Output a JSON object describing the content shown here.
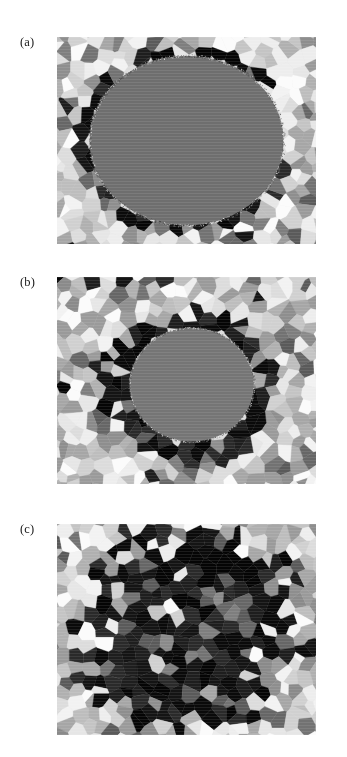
{
  "figure": {
    "background_color": "#ffffff",
    "width": 347,
    "height": 757,
    "panel_count": 3
  },
  "panels": [
    {
      "label": "(a)",
      "name": "panel-a",
      "description": "Large uniform grey elliptical particle surrounded by polycrystalline matrix with a thin ring of dark grains at the interface",
      "x": 57,
      "y": 37,
      "w": 259,
      "h": 207,
      "particle": {
        "present": true,
        "cx_pct": 50,
        "cy_pct": 50,
        "rx_pct": 37.5,
        "ry_pct": 41.0,
        "color": "#6e6e6e"
      },
      "dark_ring": {
        "present": true,
        "thickness_pct": 7,
        "coverage": "thin discontinuous",
        "color": "#0d0d0d"
      },
      "dark_fraction": 0.08,
      "seed": 1021
    },
    {
      "label": "(b)",
      "name": "panel-b",
      "description": "Shrunken grey elliptical particle with a thick continuous annulus of black grains consuming the particle boundary",
      "x": 57,
      "y": 277,
      "w": 259,
      "h": 207,
      "particle": {
        "present": true,
        "cx_pct": 52,
        "cy_pct": 52,
        "rx_pct": 24.0,
        "ry_pct": 27.5,
        "color": "#757575"
      },
      "dark_ring": {
        "present": true,
        "thickness_pct": 21,
        "coverage": "thick continuous annulus",
        "color": "#070707"
      },
      "dark_fraction": 0.3,
      "seed": 2048
    },
    {
      "label": "(c)",
      "name": "panel-c",
      "description": "Grey particle fully consumed; a large irregular cluster of black grains occupies the former particle region",
      "x": 57,
      "y": 524,
      "w": 259,
      "h": 211,
      "particle": {
        "present": false,
        "cx_pct": 50,
        "cy_pct": 50,
        "rx_pct": 0,
        "ry_pct": 0,
        "color": "#6e6e6e"
      },
      "dark_ring": {
        "present": true,
        "thickness_pct": 0,
        "coverage": "solid dark core region",
        "color": "#080808"
      },
      "dark_core": {
        "cx_pct": 50,
        "cy_pct": 49,
        "rx_pct": 39,
        "ry_pct": 43
      },
      "dark_fraction": 0.52,
      "seed": 3077
    }
  ],
  "label_positions": [
    {
      "panel": "(a)",
      "x": 20,
      "y": 36
    },
    {
      "panel": "(b)",
      "x": 20,
      "y": 276
    },
    {
      "panel": "(c)",
      "x": 20,
      "y": 523
    }
  ],
  "palette": {
    "matrix_light": [
      "#f2f2f2",
      "#e6e6e6",
      "#dcdcdc",
      "#d0d0d0",
      "#c4c4c4",
      "#bdbdbd",
      "#b0b0b0",
      "#a6a6a6",
      "#9a9a9a",
      "#8e8e8e",
      "#fbfbfb",
      "#ededed"
    ],
    "matrix_mid": [
      "#8a8a8a",
      "#7e7e7e",
      "#727272",
      "#666666",
      "#5a5a5a"
    ],
    "matrix_dark": [
      "#2a2a2a",
      "#1e1e1e",
      "#141414",
      "#0a0a0a",
      "#050505"
    ],
    "particle_grey": "#6e6e6e",
    "page_background": "#ffffff",
    "label_color": "#1a1a1a"
  },
  "grain_stats": {
    "typical_grain_px": 14,
    "grain_count_per_panel": 330,
    "boundary_style": "polygonal / voronoi-like",
    "texture": "faint horizontal scan striping"
  }
}
